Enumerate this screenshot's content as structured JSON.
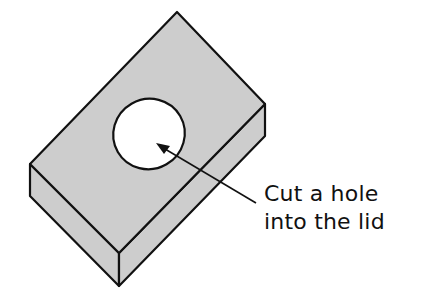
{
  "diagram": {
    "annotation": {
      "line1": "Cut a hole",
      "line2": "into the lid"
    },
    "colors": {
      "box_fill": "#cdcdcd",
      "hole_fill": "#ffffff",
      "stroke": "#111111"
    }
  }
}
